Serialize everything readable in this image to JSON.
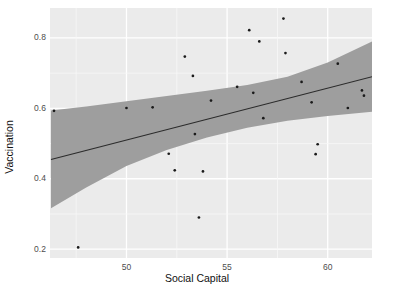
{
  "chart_data": {
    "type": "scatter",
    "title": "",
    "xlabel": "Social Capital",
    "ylabel": "Vaccination",
    "xlim": [
      46.2,
      62.2
    ],
    "ylim": [
      0.175,
      0.885
    ],
    "xticks": [
      50,
      55,
      60
    ],
    "xticklabels": [
      "50",
      "55",
      "60"
    ],
    "yticks": [
      0.2,
      0.4,
      0.6,
      0.8
    ],
    "yticklabels": [
      "0.2",
      "0.4",
      "0.6",
      "0.8"
    ],
    "grid": true,
    "grid_color": "#ffffff",
    "panel_background": "#ebebeb",
    "legend": "none",
    "point_color": "#1a1a1a",
    "line_color": "#2b2b2b",
    "ribbon_color": "#9e9e9e",
    "points": [
      {
        "x": 46.4,
        "y": 0.593
      },
      {
        "x": 47.6,
        "y": 0.205
      },
      {
        "x": 50.0,
        "y": 0.601
      },
      {
        "x": 51.3,
        "y": 0.603
      },
      {
        "x": 52.1,
        "y": 0.471
      },
      {
        "x": 52.4,
        "y": 0.424
      },
      {
        "x": 52.9,
        "y": 0.747
      },
      {
        "x": 53.3,
        "y": 0.692
      },
      {
        "x": 53.4,
        "y": 0.527
      },
      {
        "x": 53.6,
        "y": 0.29
      },
      {
        "x": 53.8,
        "y": 0.421
      },
      {
        "x": 54.2,
        "y": 0.622
      },
      {
        "x": 55.5,
        "y": 0.661
      },
      {
        "x": 56.1,
        "y": 0.822
      },
      {
        "x": 56.3,
        "y": 0.644
      },
      {
        "x": 56.6,
        "y": 0.79
      },
      {
        "x": 56.8,
        "y": 0.572
      },
      {
        "x": 57.8,
        "y": 0.855
      },
      {
        "x": 57.9,
        "y": 0.757
      },
      {
        "x": 58.7,
        "y": 0.675
      },
      {
        "x": 59.2,
        "y": 0.617
      },
      {
        "x": 59.5,
        "y": 0.498
      },
      {
        "x": 59.4,
        "y": 0.47
      },
      {
        "x": 60.5,
        "y": 0.727
      },
      {
        "x": 61.0,
        "y": 0.601
      },
      {
        "x": 61.7,
        "y": 0.651
      },
      {
        "x": 61.8,
        "y": 0.636
      }
    ],
    "fit_line": {
      "label": "linear regression",
      "x": [
        46.25,
        62.2
      ],
      "y": [
        0.455,
        0.69
      ]
    },
    "confidence_band": {
      "label": "95% confidence interval",
      "x": [
        46.25,
        48.0,
        50.0,
        52.0,
        54.0,
        56.0,
        58.0,
        60.0,
        62.2
      ],
      "upper": [
        0.594,
        0.605,
        0.62,
        0.635,
        0.65,
        0.666,
        0.69,
        0.73,
        0.79
      ],
      "lower": [
        0.316,
        0.375,
        0.436,
        0.482,
        0.517,
        0.545,
        0.565,
        0.578,
        0.59
      ]
    }
  }
}
